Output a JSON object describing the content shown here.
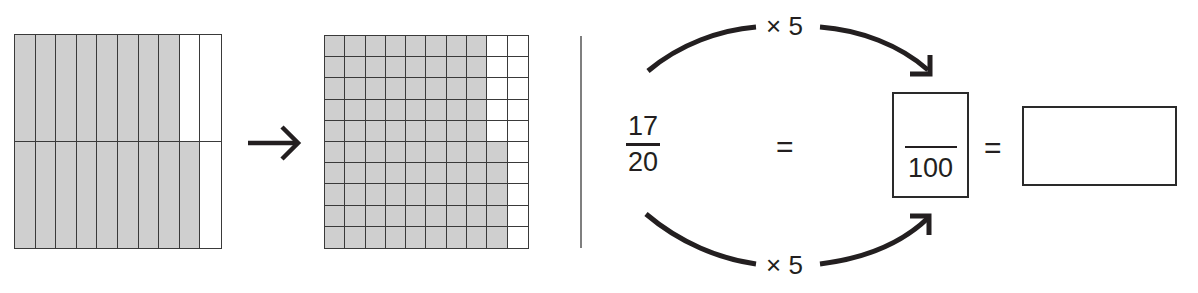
{
  "diagram": {
    "grid_twentieths": {
      "rows": 2,
      "columns": 10,
      "shaded_per_row": [
        8,
        9
      ],
      "shaded_total": 17,
      "total_cells": 20,
      "shade_color": "#cfcfcf",
      "line_color": "#3a3a3a"
    },
    "transform_arrow": {
      "glyph": "→",
      "direction": "right"
    },
    "grid_hundredths": {
      "rows": 10,
      "columns": 10,
      "shaded_per_row": [
        8,
        8,
        8,
        8,
        8,
        9,
        9,
        9,
        9,
        9
      ],
      "shaded_total": 85,
      "total_cells": 100,
      "shade_color": "#cfcfcf",
      "line_color": "#3a3a3a"
    },
    "equation": {
      "left_fraction": {
        "numerator": "17",
        "denominator": "20"
      },
      "equals_1": "=",
      "multiplier_top": "× 5",
      "multiplier_bottom": "× 5",
      "target_fraction": {
        "numerator": "",
        "denominator": "100"
      },
      "equals_2": "=",
      "answer_box_value": ""
    }
  }
}
